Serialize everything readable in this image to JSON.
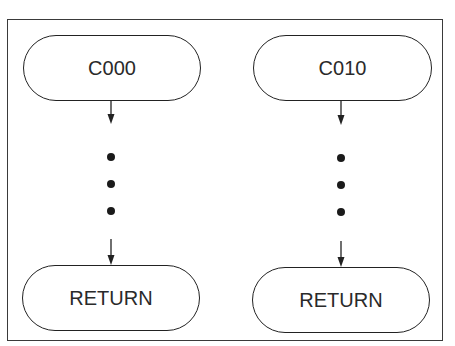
{
  "diagram": {
    "type": "flowchart",
    "colors": {
      "stroke": "#222222",
      "text": "#2a2a2a",
      "background": "#ffffff"
    },
    "columns": [
      {
        "start": {
          "label": "C000",
          "shape": "terminal"
        },
        "continuation": {
          "symbol": "ellipsis-vertical",
          "dots": 3
        },
        "end": {
          "label": "RETURN",
          "shape": "terminal"
        }
      },
      {
        "start": {
          "label": "C010",
          "shape": "terminal"
        },
        "continuation": {
          "symbol": "ellipsis-vertical",
          "dots": 3
        },
        "end": {
          "label": "RETURN",
          "shape": "terminal"
        }
      }
    ]
  }
}
